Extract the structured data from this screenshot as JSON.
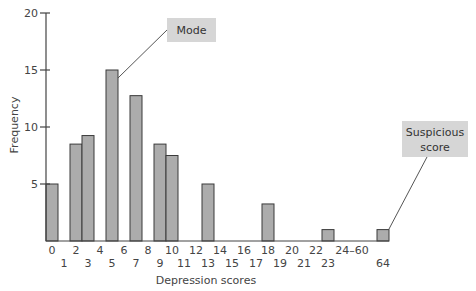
{
  "chart_data": {
    "type": "bar",
    "title": "",
    "xlabel": "Depression scores",
    "ylabel": "Frequency",
    "ylim": [
      0,
      20
    ],
    "yticks": [
      5,
      10,
      15,
      20
    ],
    "grid": false,
    "legend": null,
    "categories": [
      "0",
      "1",
      "2",
      "3",
      "4",
      "5",
      "6",
      "7",
      "8",
      "9",
      "10",
      "11",
      "12",
      "13",
      "14",
      "15",
      "16",
      "17",
      "18",
      "19",
      "20",
      "21",
      "22",
      "23",
      "24–60",
      "64"
    ],
    "values": [
      5,
      0,
      8.5,
      9.25,
      0,
      15,
      0,
      12.75,
      0,
      8.5,
      7.5,
      0,
      0,
      5,
      0,
      0,
      0,
      0,
      3.25,
      0,
      0,
      0,
      0,
      1,
      0,
      1
    ],
    "tick_labels_upper": [
      "0",
      "2",
      "4",
      "6",
      "8",
      "10",
      "12",
      "14",
      "16",
      "18",
      "20",
      "22",
      "24–60"
    ],
    "tick_labels_lower": [
      "1",
      "3",
      "5",
      "7",
      "9",
      "11",
      "13",
      "15",
      "17",
      "19",
      "21",
      "23",
      "64"
    ],
    "annotations": [
      {
        "text": "Mode",
        "points_to": "5"
      },
      {
        "text": "Suspicious score",
        "lines": [
          "Suspicious",
          "score"
        ],
        "points_to": "64"
      }
    ]
  },
  "colors": {
    "bar_fill": "#acacac",
    "bar_stroke": "#3a3a3a",
    "callout_fill": "#d6d6d6"
  }
}
